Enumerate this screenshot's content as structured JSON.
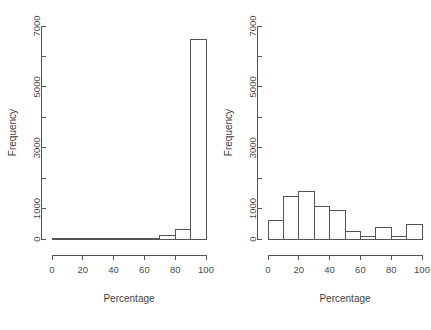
{
  "figure": {
    "background_color": "#ffffff",
    "line_color": "#555555",
    "text_color": "#3f3f3f",
    "panel_count": 2
  },
  "chart_data": [
    {
      "type": "bar",
      "title": "",
      "subtitle": "",
      "xlabel": "Percentage",
      "ylabel": "Frequency",
      "xlim": [
        0,
        100
      ],
      "ylim": [
        0,
        7000
      ],
      "xticks": [
        0,
        20,
        40,
        60,
        80,
        100
      ],
      "xtick_labels": [
        "0",
        "20",
        "40",
        "60",
        "80",
        "100"
      ],
      "yticks": [
        0,
        1000,
        3000,
        5000,
        7000
      ],
      "ytick_labels": [
        "0",
        "1000",
        "3000",
        "5000",
        "7000"
      ],
      "yticks_minor": [
        2000,
        4000,
        6000
      ],
      "grid": false,
      "legend": false,
      "bin_width": 10,
      "bin_edges": [
        0,
        10,
        20,
        30,
        40,
        50,
        60,
        70,
        80,
        90,
        100
      ],
      "categories": [
        "0-10",
        "10-20",
        "20-30",
        "30-40",
        "40-50",
        "50-60",
        "60-70",
        "70-80",
        "80-90",
        "90-100"
      ],
      "values": [
        0,
        0,
        0,
        0,
        0,
        0,
        25,
        110,
        300,
        6550
      ]
    },
    {
      "type": "bar",
      "title": "",
      "subtitle": "",
      "xlabel": "Percentage",
      "ylabel": "Frequency",
      "xlim": [
        0,
        100
      ],
      "ylim": [
        0,
        7000
      ],
      "xticks": [
        0,
        20,
        40,
        60,
        80,
        100
      ],
      "xtick_labels": [
        "0",
        "20",
        "40",
        "60",
        "80",
        "100"
      ],
      "yticks": [
        0,
        1000,
        3000,
        5000,
        7000
      ],
      "ytick_labels": [
        "0",
        "1000",
        "3000",
        "5000",
        "7000"
      ],
      "yticks_minor": [
        2000,
        4000,
        6000
      ],
      "grid": false,
      "legend": false,
      "bin_width": 10,
      "bin_edges": [
        0,
        10,
        20,
        30,
        40,
        50,
        60,
        70,
        80,
        90,
        100
      ],
      "categories": [
        "0-10",
        "10-20",
        "20-30",
        "30-40",
        "40-50",
        "50-60",
        "60-70",
        "70-80",
        "80-90",
        "90-100"
      ],
      "values": [
        620,
        1400,
        1550,
        1070,
        930,
        240,
        90,
        370,
        80,
        470
      ]
    }
  ]
}
